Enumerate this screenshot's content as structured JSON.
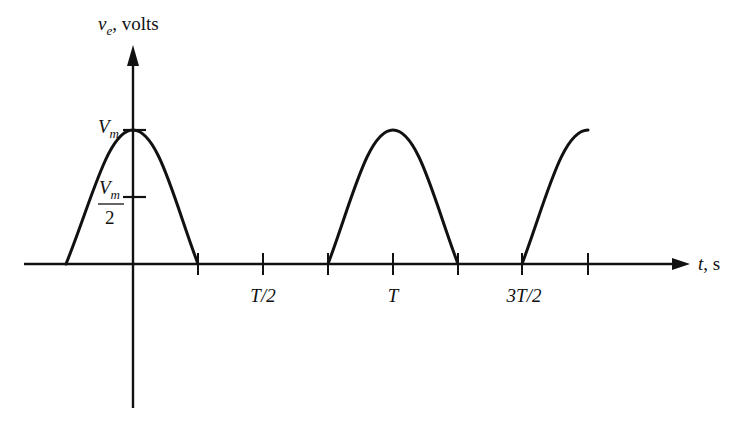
{
  "diagram": {
    "type": "waveform",
    "y_axis": {
      "label_var": "v",
      "label_sub": "e",
      "label_unit": ", volts",
      "ticks": [
        {
          "label_main": "V",
          "label_sub": "m",
          "value": "Vm"
        },
        {
          "label_num_main": "V",
          "label_num_sub": "m",
          "label_den": "2",
          "value": "Vm/2"
        }
      ]
    },
    "x_axis": {
      "label_var": "t",
      "label_unit": ", s",
      "tick_labels": [
        "T/2",
        "T",
        "3T/2"
      ]
    },
    "stroke_color": "#111111",
    "background": "#ffffff"
  }
}
